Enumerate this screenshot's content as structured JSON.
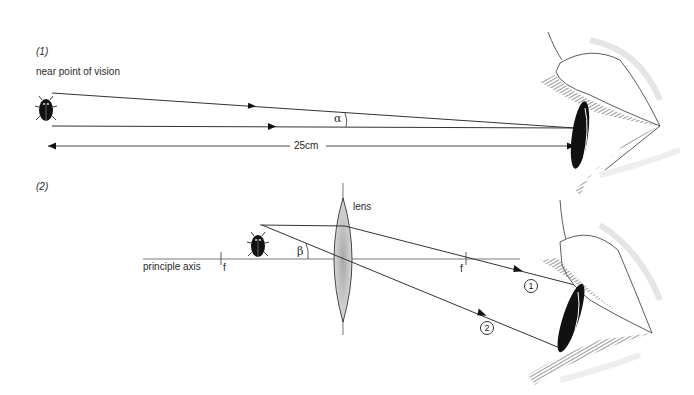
{
  "panel1": {
    "number": "(1)",
    "caption": "near point of vision",
    "angle_label": "α",
    "distance_label": "25cm"
  },
  "panel2": {
    "number": "(2)",
    "lens_label": "lens",
    "axis_label": "principle axis",
    "focal_left": "f",
    "focal_right": "f",
    "angle_label": "β",
    "ray1_marker": "1",
    "ray2_marker": "2"
  },
  "colors": {
    "line": "#333333",
    "lens_fill": "#c8c8c8",
    "beetle": "#111111",
    "background": "#ffffff"
  }
}
